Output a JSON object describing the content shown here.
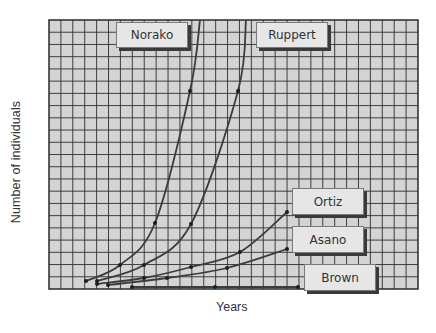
{
  "chart_data": {
    "type": "line",
    "title": "",
    "xlabel": "Years",
    "ylabel": "Number of individuals",
    "grid": true,
    "legend_position": "inline labels",
    "x_ticks": [],
    "y_ticks": [],
    "plot_box_px": {
      "x0": 49,
      "y0": 20,
      "x1": 418,
      "y1": 289
    },
    "series": [
      {
        "name": "Norako",
        "points_px": [
          [
            86,
            281
          ],
          [
            120,
            265
          ],
          [
            155,
            223
          ],
          [
            190,
            91
          ],
          [
            200,
            20
          ]
        ],
        "label_box": [
          116,
          22,
          72,
          26
        ]
      },
      {
        "name": "Ruppert",
        "points_px": [
          [
            97,
            281
          ],
          [
            144,
            265
          ],
          [
            191,
            224
          ],
          [
            238,
            91
          ],
          [
            246,
            20
          ]
        ],
        "label_box": [
          256,
          22,
          72,
          26
        ]
      },
      {
        "name": "Ortiz",
        "points_px": [
          [
            97,
            284
          ],
          [
            144,
            278
          ],
          [
            191,
            267
          ],
          [
            240,
            252
          ],
          [
            287,
            212
          ]
        ],
        "label_box": [
          292,
          188,
          72,
          27
        ]
      },
      {
        "name": "Asano",
        "points_px": [
          [
            108,
            285
          ],
          [
            167,
            278
          ],
          [
            227,
            268
          ],
          [
            287,
            249
          ]
        ],
        "label_box": [
          292,
          226,
          72,
          27
        ]
      },
      {
        "name": "Brown",
        "points_px": [
          [
            132,
            287
          ],
          [
            215,
            287
          ],
          [
            298,
            287
          ]
        ],
        "label_box": [
          304,
          264,
          72,
          27
        ]
      }
    ]
  }
}
